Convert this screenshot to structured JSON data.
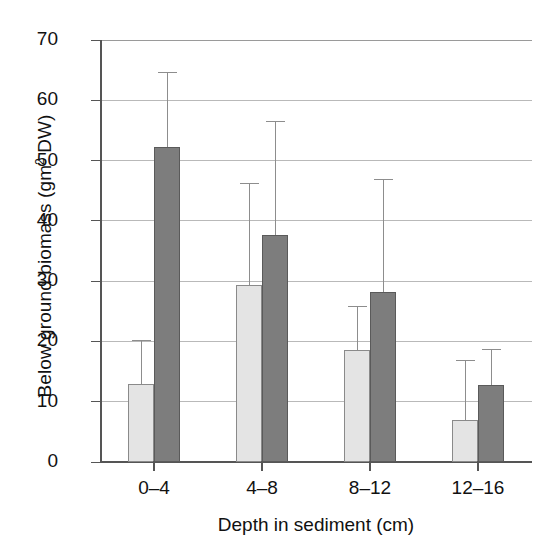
{
  "chart_data": {
    "type": "bar",
    "title": "",
    "subtitle": "",
    "xlabel": "Depth in sediment (cm)",
    "ylabel_prefix": "Below ground biomass (gm",
    "ylabel_sup": "2",
    "ylabel_suffix": " DW)",
    "ylabel_plain": "Below ground biomass (gm2 DW)",
    "categories": [
      "0–4",
      "4–8",
      "8–12",
      "12–16"
    ],
    "ylim": [
      0,
      70
    ],
    "yticks": [
      0,
      10,
      20,
      30,
      40,
      50,
      60,
      70
    ],
    "ytick_labels": [
      "0",
      "10",
      "20",
      "30",
      "40",
      "50",
      "60",
      "70"
    ],
    "grid": true,
    "grid_axis": "y",
    "legend": "none",
    "orientation": "vertical",
    "series": [
      {
        "name": "light-series",
        "color": "#e4e4e4",
        "edge_color": "#8a8a8a",
        "values": [
          12.9,
          29.3,
          18.5,
          7.0
        ],
        "errors_upper": [
          20.2,
          46.3,
          25.8,
          17.0
        ]
      },
      {
        "name": "dark-series",
        "color": "#7d7d7d",
        "edge_color": "#5a5a5a",
        "values": [
          52.3,
          37.7,
          28.2,
          12.8
        ],
        "errors_upper": [
          64.7,
          56.5,
          47.0,
          18.8
        ]
      }
    ]
  },
  "colors": {
    "background": "#ffffff",
    "axis": "#555555",
    "grid": "#b9b9b9",
    "text": "#111111"
  }
}
